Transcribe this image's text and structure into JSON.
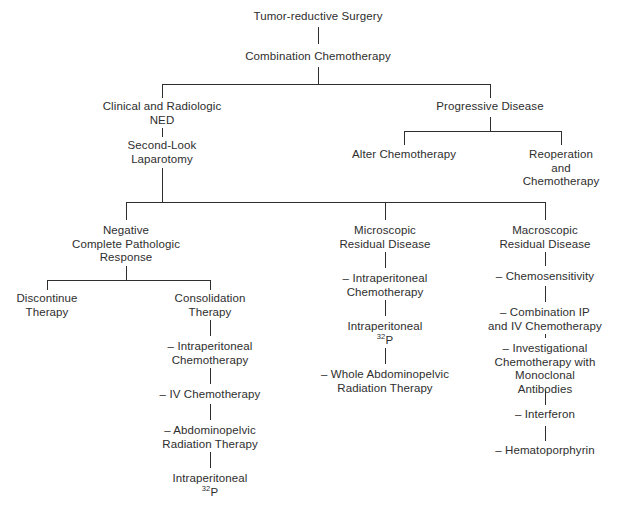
{
  "diagram": {
    "type": "flowchart",
    "text_color": "#2e2e2e",
    "background_color": "#ffffff",
    "nodes": [
      {
        "id": "tumor_reductive_surgery",
        "lines": [
          "Tumor-reductive Surgery"
        ],
        "x": 318,
        "y": 10
      },
      {
        "id": "combination_chemotherapy",
        "lines": [
          "Combination Chemotherapy"
        ],
        "x": 318,
        "y": 50
      },
      {
        "id": "clinical_radiologic_ned",
        "lines": [
          "Clinical and Radiologic",
          "NED"
        ],
        "x": 162,
        "y": 100
      },
      {
        "id": "second_look_laparotomy",
        "lines": [
          "Second-Look",
          "Laparotomy"
        ],
        "x": 162,
        "y": 139
      },
      {
        "id": "progressive_disease",
        "lines": [
          "Progressive Disease"
        ],
        "x": 490,
        "y": 100
      },
      {
        "id": "alter_chemotherapy",
        "lines": [
          "Alter Chemotherapy"
        ],
        "x": 404,
        "y": 148
      },
      {
        "id": "reoperation_and_chemotherapy",
        "lines": [
          "Reoperation",
          "and",
          "Chemotherapy"
        ],
        "x": 561,
        "y": 148
      },
      {
        "id": "negative_complete_pathologic_response",
        "lines": [
          "Negative",
          "Complete Pathologic",
          "Response"
        ],
        "x": 126,
        "y": 224
      },
      {
        "id": "discontinue_therapy",
        "lines": [
          "Discontinue",
          "Therapy"
        ],
        "x": 47,
        "y": 292
      },
      {
        "id": "consolidation_therapy",
        "lines": [
          "Consolidation",
          "Therapy"
        ],
        "x": 210,
        "y": 292
      },
      {
        "id": "consolidation_intraperitoneal_chemo",
        "lines": [
          "– Intraperitoneal",
          "Chemotherapy"
        ],
        "x": 210,
        "y": 340
      },
      {
        "id": "consolidation_iv_chemo",
        "lines": [
          "– IV Chemotherapy"
        ],
        "x": 210,
        "y": 388
      },
      {
        "id": "consolidation_abdominopelvic_radiation",
        "lines": [
          "– Abdominopelvic",
          "Radiation Therapy"
        ],
        "x": 210,
        "y": 424
      },
      {
        "id": "consolidation_intraperitoneal_p32",
        "lines": [
          "Intraperitoneal",
          "32P"
        ],
        "x": 210,
        "y": 472,
        "superscript_line": 1,
        "superscript_text": "32",
        "base_text": "P"
      },
      {
        "id": "microscopic_residual_disease",
        "lines": [
          "Microscopic",
          "Residual Disease"
        ],
        "x": 385,
        "y": 224
      },
      {
        "id": "micro_intraperitoneal_chemo",
        "lines": [
          "– Intraperitoneal",
          "Chemotherapy"
        ],
        "x": 385,
        "y": 272
      },
      {
        "id": "micro_intraperitoneal_p32",
        "lines": [
          "Intraperitoneal",
          "32P"
        ],
        "x": 385,
        "y": 320,
        "superscript_line": 1,
        "superscript_text": "32",
        "base_text": "P"
      },
      {
        "id": "micro_whole_abdominopelvic_radiation",
        "lines": [
          "– Whole Abdominopelvic",
          "Radiation Therapy"
        ],
        "x": 385,
        "y": 368
      },
      {
        "id": "macroscopic_residual_disease",
        "lines": [
          "Macroscopic",
          "Residual Disease"
        ],
        "x": 545,
        "y": 224
      },
      {
        "id": "macro_chemosensitivity",
        "lines": [
          "– Chemosensitivity"
        ],
        "x": 545,
        "y": 270
      },
      {
        "id": "macro_combination_ip_iv",
        "lines": [
          "– Combination IP",
          "and IV Chemotherapy"
        ],
        "x": 545,
        "y": 306
      },
      {
        "id": "macro_investigational_chemo_mabs",
        "lines": [
          "– Investigational",
          "Chemotherapy with",
          "Monoclonal",
          "Antibodies"
        ],
        "x": 545,
        "y": 342
      },
      {
        "id": "macro_interferon",
        "lines": [
          "– Interferon"
        ],
        "x": 545,
        "y": 408
      },
      {
        "id": "macro_hematoporphyrin",
        "lines": [
          "– Hematoporphyrin"
        ],
        "x": 545,
        "y": 444
      }
    ],
    "connectors": {
      "vertical": [
        {
          "id": "surgery-to-combo",
          "x": 318,
          "y": 27,
          "length": 17
        },
        {
          "id": "combo-to-split1",
          "x": 318,
          "y": 67,
          "length": 17
        },
        {
          "id": "split1-to-ned",
          "x": 162,
          "y": 84,
          "length": 14
        },
        {
          "id": "split1-to-progressive",
          "x": 490,
          "y": 84,
          "length": 14
        },
        {
          "id": "ned-to-secondlook",
          "x": 162,
          "y": 128,
          "length": 9
        },
        {
          "id": "progressive-to-split2",
          "x": 490,
          "y": 117,
          "length": 14
        },
        {
          "id": "split2-to-alter",
          "x": 404,
          "y": 131,
          "length": 14
        },
        {
          "id": "split2-to-reoperation",
          "x": 561,
          "y": 131,
          "length": 14
        },
        {
          "id": "secondlook-to-split3",
          "x": 162,
          "y": 168,
          "length": 34
        },
        {
          "id": "split3-to-negative",
          "x": 126,
          "y": 202,
          "length": 18
        },
        {
          "id": "split3-to-microscopic",
          "x": 385,
          "y": 202,
          "length": 18
        },
        {
          "id": "split3-to-macroscopic",
          "x": 545,
          "y": 202,
          "length": 18
        },
        {
          "id": "negative-to-split4",
          "x": 126,
          "y": 266,
          "length": 14
        },
        {
          "id": "split4-to-discontinue",
          "x": 47,
          "y": 280,
          "length": 10
        },
        {
          "id": "split4-to-consolidation",
          "x": 210,
          "y": 280,
          "length": 10
        },
        {
          "id": "consolidation-to-ipchemo",
          "x": 210,
          "y": 320,
          "length": 16
        },
        {
          "id": "ipchemo-to-ivchemo",
          "x": 210,
          "y": 368,
          "length": 16
        },
        {
          "id": "ivchemo-to-abdomino",
          "x": 210,
          "y": 404,
          "length": 16
        },
        {
          "id": "abdomino-to-ip32p",
          "x": 210,
          "y": 452,
          "length": 16
        },
        {
          "id": "microscopic-to-ipchemo",
          "x": 385,
          "y": 252,
          "length": 16
        },
        {
          "id": "ipchemo-to-ip32p-mid",
          "x": 385,
          "y": 300,
          "length": 16
        },
        {
          "id": "ip32p-to-whole-mid",
          "x": 385,
          "y": 348,
          "length": 16
        },
        {
          "id": "macroscopic-to-chemosens",
          "x": 545,
          "y": 252,
          "length": 14
        },
        {
          "id": "chemosens-to-combination",
          "x": 545,
          "y": 286,
          "length": 16
        },
        {
          "id": "combination-to-investigational",
          "x": 545,
          "y": 334,
          "length": 4
        },
        {
          "id": "investigational-to-interferon",
          "x": 545,
          "y": 390,
          "length": 15
        },
        {
          "id": "interferon-to-hematoporphyrin",
          "x": 545,
          "y": 426,
          "length": 15
        }
      ],
      "horizontal": [
        {
          "id": "split1-bar",
          "x": 162,
          "y": 84,
          "width": 328
        },
        {
          "id": "split2-bar",
          "x": 404,
          "y": 131,
          "width": 157
        },
        {
          "id": "split3-bar",
          "x": 126,
          "y": 202,
          "width": 419
        },
        {
          "id": "split4-bar",
          "x": 47,
          "y": 280,
          "width": 163
        }
      ]
    }
  }
}
